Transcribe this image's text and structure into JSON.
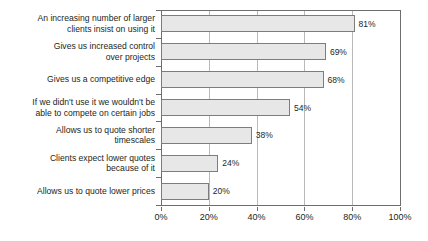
{
  "chart_data": {
    "type": "bar",
    "orientation": "horizontal",
    "title": "",
    "subtitle": "",
    "xlabel": "",
    "ylabel": "",
    "xlim": [
      0,
      100
    ],
    "grid": true,
    "legend": null,
    "legend_position": "none",
    "x_ticks": [
      "0%",
      "20%",
      "40%",
      "60%",
      "80%",
      "100%"
    ],
    "x_tick_values": [
      0,
      20,
      40,
      60,
      80,
      100
    ],
    "categories": [
      "An increasing number of larger clients insist on using it",
      "Gives us increased control over projects",
      "Gives us a competitive edge",
      "If we didn't use it we wouldn't be able to compete on certain jobs",
      "Allows us to quote shorter timescales",
      "Clients expect lower quotes because of it",
      "Allows us to quote lower prices"
    ],
    "category_lines": [
      [
        "An increasing number of larger",
        "clients insist on using it"
      ],
      [
        "Gives us increased control",
        "over projects"
      ],
      [
        "Gives us a competitive edge"
      ],
      [
        "If we didn't use it we wouldn't be",
        "able to compete on certain jobs"
      ],
      [
        "Allows us to quote shorter",
        "timescales"
      ],
      [
        "Clients expect lower quotes",
        "because of it"
      ],
      [
        "Allows us to quote lower prices"
      ]
    ],
    "values": [
      81,
      69,
      68,
      54,
      38,
      24,
      20
    ],
    "value_labels": [
      "81%",
      "69%",
      "68%",
      "54%",
      "38%",
      "24%",
      "20%"
    ],
    "colors": {
      "bar_fill": "#e7e7e7",
      "bar_border": "#7d7d7d",
      "grid": "#b9b9b9",
      "axis": "#6e6e6e",
      "text": "#231f20",
      "background": "#ffffff"
    }
  }
}
